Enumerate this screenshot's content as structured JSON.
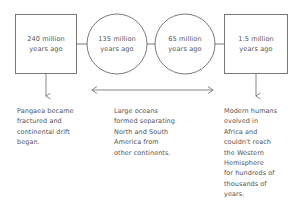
{
  "diagram": {
    "type": "timeline-flow",
    "stroke_color": "#6b6b6b",
    "text_color": "#555555",
    "background": "#ffffff",
    "nodes": [
      {
        "id": "node-1",
        "shape": "rectangle",
        "label": "240 million\nyears ago",
        "time_value": "240 million years ago"
      },
      {
        "id": "node-2",
        "shape": "circle",
        "label": "135 million\nyears ago",
        "time_value": "135 million years ago"
      },
      {
        "id": "node-3",
        "shape": "circle",
        "label": "65 million\nyears ago",
        "time_value": "65 million years ago"
      },
      {
        "id": "node-4",
        "shape": "rectangle",
        "label": "1.5 million\nyears ago",
        "time_value": "1.5 million years ago"
      }
    ],
    "descriptions": [
      {
        "id": "desc-1",
        "text": "Pangaea became\nfractured and\ncontinental drift\nbegan."
      },
      {
        "id": "desc-2",
        "text": "Large oceans\nformed separating\nNorth and South\nAmerica from\nother continents."
      },
      {
        "id": "desc-3",
        "text": "Modern humans\nevolved in\nAfrica and\ncouldn't reach\nthe Western\nHemisphere\nfor hundreds of\nthousands of\nyears."
      }
    ],
    "connectors": [
      {
        "id": "connector-1-2",
        "kind": "horizontal-line"
      },
      {
        "id": "connector-2-3",
        "kind": "horizontal-line"
      },
      {
        "id": "connector-3-4",
        "kind": "horizontal-line"
      },
      {
        "id": "arrow-down-left",
        "kind": "arrow-down"
      },
      {
        "id": "arrow-double-center",
        "kind": "arrow-double-horizontal"
      },
      {
        "id": "arrow-down-right",
        "kind": "arrow-down"
      }
    ]
  }
}
